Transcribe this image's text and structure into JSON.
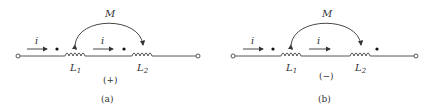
{
  "figure": {
    "panels": [
      {
        "id": "a",
        "caption": "(a)",
        "sign": "(+)",
        "mutual_label": "M",
        "current_label_1": "i",
        "current_label_2": "i",
        "inductor_1": {
          "name": "L",
          "sub": "1"
        },
        "inductor_2": {
          "name": "L",
          "sub": "2"
        },
        "dot_positions": [
          "left-of-L1",
          "left-of-L2"
        ]
      },
      {
        "id": "b",
        "caption": "(b)",
        "sign": "(−)",
        "mutual_label": "M",
        "current_label_1": "i",
        "current_label_2": "i",
        "inductor_1": {
          "name": "L",
          "sub": "1"
        },
        "inductor_2": {
          "name": "L",
          "sub": "2"
        },
        "dot_positions": [
          "left-of-L1",
          "right-of-L2"
        ]
      }
    ],
    "colors": {
      "stroke": "#444444",
      "text": "#333333",
      "background": "#ffffff"
    }
  }
}
